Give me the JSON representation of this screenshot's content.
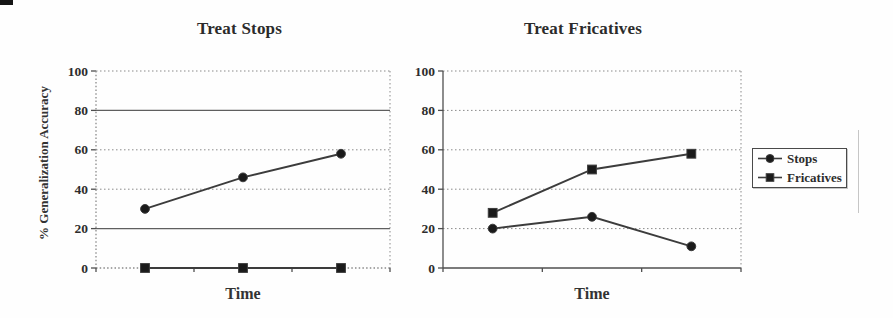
{
  "figure": {
    "background": "#fefefe",
    "description_visible_text_only": true
  },
  "chart_data": [
    {
      "type": "line",
      "title": "Treat Stops",
      "xlabel": "Time",
      "ylabel": "% Generalization Accuracy",
      "ylim": [
        0,
        100
      ],
      "yticks": [
        0,
        20,
        40,
        60,
        80,
        100
      ],
      "x_tick_labels": [
        "",
        "",
        ""
      ],
      "grid": true,
      "series": [
        {
          "name": "Stops",
          "marker": "circle",
          "values": [
            30,
            46,
            58
          ]
        },
        {
          "name": "Fricatives",
          "marker": "square",
          "values": [
            0,
            0,
            0
          ]
        }
      ]
    },
    {
      "type": "line",
      "title": "Treat Fricatives",
      "xlabel": "Time",
      "ylabel": "",
      "ylim": [
        0,
        100
      ],
      "yticks": [
        0,
        20,
        40,
        60,
        80,
        100
      ],
      "x_tick_labels": [
        "",
        "",
        ""
      ],
      "grid": true,
      "legend_position": "right",
      "series": [
        {
          "name": "Stops",
          "marker": "circle",
          "values": [
            20,
            26,
            11
          ]
        },
        {
          "name": "Fricatives",
          "marker": "square",
          "values": [
            28,
            50,
            58
          ]
        }
      ]
    }
  ],
  "legend": {
    "entries": [
      {
        "label": "Stops",
        "marker": "circle"
      },
      {
        "label": "Fricatives",
        "marker": "square"
      }
    ]
  },
  "colors": {
    "background": "#fefefe",
    "text": "#2d2d2d",
    "series_line": "#3c3c3c",
    "marker_fill": "#1a1a1a",
    "grid_dotted": "#8a8a8a",
    "grid_solid": "#5f5f5f",
    "axis": "#4f4f4f",
    "legend_border": "#4a4a4a"
  }
}
